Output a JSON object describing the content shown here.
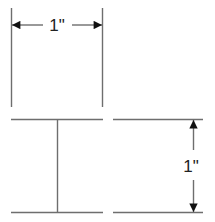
{
  "diagram": {
    "top_figure": {
      "dimension_label": "1\"",
      "orientation": "horizontal"
    },
    "bottom_right_figure": {
      "dimension_label": "1\"",
      "orientation": "vertical"
    },
    "colors": {
      "line": "#6e6e6e",
      "arrow": "#111111",
      "text": "#222222",
      "background": "#ffffff"
    }
  }
}
